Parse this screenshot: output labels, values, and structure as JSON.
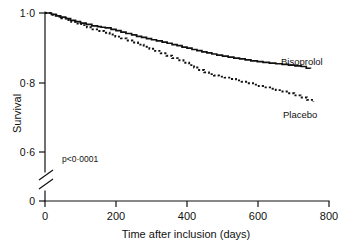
{
  "chart_data": {
    "type": "line",
    "title": "",
    "subtitle": "",
    "xlabel": "Time after inclusion (days)",
    "ylabel": "Survival",
    "xlim": [
      0,
      800
    ],
    "ylim": [
      0.6,
      1.0
    ],
    "y_axis_break": true,
    "y_axis_break_note": "axis broken between 0 and 0.6",
    "grid": false,
    "legend_position": "inline-right",
    "xticks": [
      0,
      200,
      400,
      600,
      800
    ],
    "xtick_labels": [
      "0",
      "200",
      "400",
      "600",
      "800"
    ],
    "yticks": [
      0,
      0.6,
      0.8,
      1.0
    ],
    "ytick_labels": [
      "0",
      "0·0",
      "0·8",
      "1·0"
    ],
    "ytick_labels_display": [
      "1·0",
      "0·8",
      "0·6",
      "0"
    ],
    "annotations": [
      {
        "name": "p-value",
        "text": "p<0·0001",
        "x": 60,
        "y": 0.655
      }
    ],
    "series": [
      {
        "name": "Bisoprolol",
        "style": "solid",
        "color": "#111111",
        "label_x": 660,
        "label_y": 0.872,
        "x": [
          0,
          18,
          30,
          44,
          58,
          72,
          86,
          100,
          116,
          132,
          148,
          158,
          170,
          186,
          200,
          214,
          228,
          244,
          258,
          272,
          286,
          300,
          314,
          330,
          344,
          358,
          372,
          386,
          400,
          414,
          428,
          442,
          456,
          470,
          484,
          500,
          516,
          532,
          548,
          564,
          580,
          598,
          614,
          632,
          650,
          668,
          686,
          704,
          722,
          736,
          748
        ],
        "y": [
          1.0,
          0.996,
          0.992,
          0.988,
          0.984,
          0.979,
          0.975,
          0.971,
          0.967,
          0.963,
          0.961,
          0.959,
          0.957,
          0.953,
          0.949,
          0.945,
          0.941,
          0.937,
          0.933,
          0.93,
          0.926,
          0.923,
          0.92,
          0.916,
          0.913,
          0.909,
          0.906,
          0.902,
          0.899,
          0.895,
          0.892,
          0.888,
          0.885,
          0.882,
          0.879,
          0.876,
          0.873,
          0.87,
          0.868,
          0.865,
          0.862,
          0.86,
          0.858,
          0.856,
          0.854,
          0.852,
          0.85,
          0.848,
          0.846,
          0.841,
          0.84
        ]
      },
      {
        "name": "Placebo",
        "style": "dashed",
        "color": "#111111",
        "label_x": 670,
        "label_y": 0.765,
        "x": [
          0,
          18,
          32,
          46,
          60,
          74,
          88,
          102,
          118,
          134,
          150,
          166,
          182,
          198,
          214,
          230,
          246,
          262,
          278,
          294,
          310,
          326,
          342,
          358,
          374,
          390,
          406,
          420,
          434,
          448,
          462,
          476,
          490,
          506,
          522,
          538,
          554,
          570,
          586,
          602,
          618,
          634,
          650,
          666,
          684,
          702,
          720,
          738,
          756
        ],
        "y": [
          1.0,
          0.995,
          0.99,
          0.985,
          0.98,
          0.975,
          0.97,
          0.965,
          0.959,
          0.953,
          0.948,
          0.943,
          0.938,
          0.932,
          0.927,
          0.921,
          0.915,
          0.909,
          0.903,
          0.897,
          0.891,
          0.884,
          0.877,
          0.87,
          0.864,
          0.857,
          0.85,
          0.843,
          0.836,
          0.829,
          0.824,
          0.82,
          0.817,
          0.814,
          0.81,
          0.806,
          0.802,
          0.798,
          0.794,
          0.79,
          0.786,
          0.782,
          0.778,
          0.774,
          0.769,
          0.763,
          0.757,
          0.75,
          0.744
        ]
      }
    ]
  },
  "axis": {
    "ylabel": "Survival",
    "xlabel": "Time after inclusion (days)",
    "ytick_1_0": "1·0",
    "ytick_0_8": "0·8",
    "ytick_0_6": "0·6",
    "ytick_0": "0",
    "xtick_0": "0",
    "xtick_200": "200",
    "xtick_400": "400",
    "xtick_600": "600",
    "xtick_800": "800"
  },
  "labels": {
    "series_bisoprolol": "Bisoprolol",
    "series_placebo": "Placebo",
    "pvalue": "p<0·0001"
  },
  "colors": {
    "ink": "#111111",
    "background": "#ffffff"
  }
}
